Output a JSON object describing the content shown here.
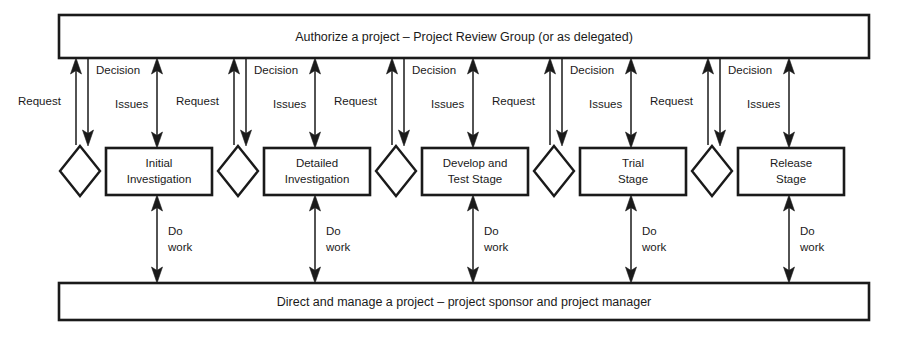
{
  "diagram": {
    "type": "process-flow",
    "title_top_band": "Authorize a project – Project Review Group (or as delegated)",
    "title_bottom_band": "Direct and manage a project – project sponsor and project manager",
    "top_band": {
      "label": "Authorize a project – Project Review Group (or as delegated)"
    },
    "bottom_band": {
      "label": "Direct and manage a project – project sponsor and project manager"
    },
    "gates": [
      {
        "name": "gate-1"
      },
      {
        "name": "gate-2"
      },
      {
        "name": "gate-3"
      },
      {
        "name": "gate-4"
      },
      {
        "name": "gate-5"
      }
    ],
    "stages": [
      {
        "line1": "Initial",
        "line2": "Investigation"
      },
      {
        "line1": "Detailed",
        "line2": "Investigation"
      },
      {
        "line1": "Develop and",
        "line2": "Test Stage"
      },
      {
        "line1": "Trial",
        "line2": "Stage"
      },
      {
        "line1": "Release",
        "line2": "Stage"
      }
    ],
    "edge_labels": {
      "request": "Request",
      "decision": "Decision",
      "issues": "Issues",
      "do_work_line1": "Do",
      "do_work_line2": "work"
    },
    "groups": [
      {
        "request": "Request",
        "decision": "Decision",
        "issues": "Issues",
        "do_work_line1": "Do",
        "do_work_line2": "work"
      },
      {
        "request": "Request",
        "decision": "Decision",
        "issues": "Issues",
        "do_work_line1": "Do",
        "do_work_line2": "work"
      },
      {
        "request": "Request",
        "decision": "Decision",
        "issues": "Issues",
        "do_work_line1": "Do",
        "do_work_line2": "work"
      },
      {
        "request": "Request",
        "decision": "Decision",
        "issues": "Issues",
        "do_work_line1": "Do",
        "do_work_line2": "work"
      },
      {
        "request": "Request",
        "decision": "Decision",
        "issues": "Issues",
        "do_work_line1": "Do",
        "do_work_line2": "work"
      }
    ],
    "colors": {
      "stroke": "#1a1a1a",
      "fill": "#ffffff",
      "background": "#ffffff"
    }
  }
}
